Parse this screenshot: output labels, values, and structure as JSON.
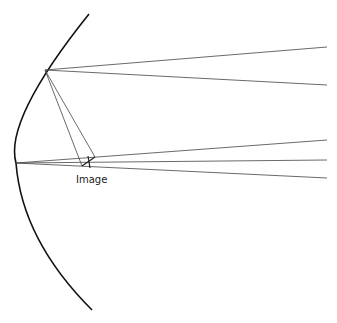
{
  "diagram": {
    "type": "concave-mirror-ray-diagram",
    "labels": {
      "image": "Image"
    },
    "colors": {
      "mirror": "#111111",
      "rays": "#444444",
      "background": "#ffffff"
    },
    "mirror": {
      "top": [
        89,
        14
      ],
      "vertex": [
        16,
        163
      ],
      "bottom": [
        92,
        310
      ]
    },
    "rays_from_upper_point": {
      "origin": [
        45,
        70
      ],
      "to_right": [
        [
          327,
          47
        ],
        [
          327,
          85
        ]
      ]
    },
    "rays_from_vertex": {
      "origin": [
        16,
        163
      ],
      "to_right": [
        [
          327,
          140
        ],
        [
          327,
          160
        ],
        [
          327,
          178
        ]
      ]
    },
    "image_point": [
      88,
      160
    ]
  }
}
